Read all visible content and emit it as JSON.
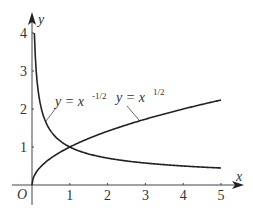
{
  "chart_data": {
    "type": "line",
    "title": "",
    "xlabel": "x",
    "ylabel": "y",
    "origin_label": "O",
    "xlim": [
      0,
      5
    ],
    "ylim": [
      0,
      4
    ],
    "x_ticks": [
      "1",
      "2",
      "3",
      "4",
      "5"
    ],
    "y_ticks": [
      "1",
      "2",
      "3",
      "4"
    ],
    "grid": false,
    "series": [
      {
        "name": "y = x^{1/2}",
        "label_prefix": "y = x",
        "label_exp": "1/2",
        "x": [
          0,
          0.25,
          0.5,
          1,
          2,
          3,
          4,
          5
        ],
        "values": [
          0,
          0.5,
          0.71,
          1,
          1.41,
          1.73,
          2,
          2.24
        ]
      },
      {
        "name": "y = x^{-1/2}",
        "label_prefix": "y = x",
        "label_exp": "-1/2",
        "x": [
          0.0625,
          0.1,
          0.25,
          0.5,
          1,
          2,
          3,
          4,
          5
        ],
        "values": [
          4,
          3.16,
          2,
          1.41,
          1,
          0.71,
          0.58,
          0.5,
          0.45
        ]
      }
    ],
    "annotations": [
      "y = x^{-1/2} (leader line to decreasing curve)",
      "y = x^{1/2} (leader line to increasing curve)"
    ]
  }
}
